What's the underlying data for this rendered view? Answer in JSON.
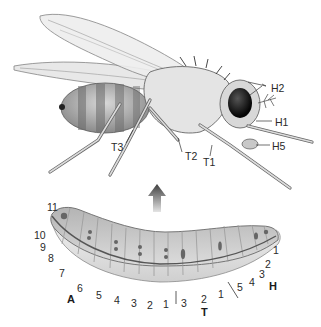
{
  "figure": {
    "fly_labels": {
      "h2": "H2",
      "h1": "H1",
      "h5": "H5",
      "t1": "T1",
      "t2": "T2",
      "t3": "T3"
    },
    "larva_region_labels": {
      "head": "H",
      "thorax": "T",
      "abdomen": "A"
    },
    "larva_head_segments": [
      "1",
      "2",
      "3",
      "4",
      "5"
    ],
    "larva_thorax_segments": [
      "1",
      "2",
      "3"
    ],
    "larva_abdomen_segments": [
      "1",
      "2",
      "3",
      "4",
      "5",
      "6",
      "7",
      "8",
      "9",
      "10",
      "11"
    ],
    "arrow": "up-arrow",
    "colors": {
      "outline": "#3a3a3a",
      "body_light": "#e9e9e9",
      "body_mid": "#bdbdbd",
      "body_dark": "#6e6e6e",
      "eye": "#111111",
      "arrow_dark": "#4a4a4a",
      "arrow_light": "#cfcfcf",
      "larva_band": "#5a5a5a"
    }
  }
}
